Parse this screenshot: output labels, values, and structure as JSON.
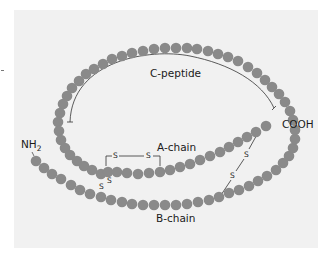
{
  "colors": {
    "bead": "#8a8a8a",
    "panel": "#f1f1f1",
    "line": "#333333",
    "text": "#1a1a1a"
  },
  "labels": {
    "c_peptide": "C-peptide",
    "a_chain": "A-chain",
    "b_chain": "B-chain",
    "n_terminus": "NH",
    "n_terminus_sub": "2",
    "c_terminus": "COOH",
    "disulfide": "S"
  },
  "disulfide_bonds": [
    {
      "name": "intra-A-chain",
      "from": "A6",
      "to": "A11",
      "label": "S—S"
    },
    {
      "name": "A7-B7",
      "label": "S S"
    },
    {
      "name": "A20-B19",
      "label": "S S"
    }
  ],
  "chain": {
    "bead_radius": 5.3,
    "b_chain": [
      [
        36,
        161
      ],
      [
        44,
        168
      ],
      [
        52,
        174
      ],
      [
        61,
        179
      ],
      [
        71,
        185
      ],
      [
        80,
        190
      ],
      [
        90,
        194
      ],
      [
        101,
        197
      ],
      [
        111,
        200
      ],
      [
        122,
        202
      ],
      [
        132,
        204
      ],
      [
        143,
        205
      ],
      [
        154,
        205
      ],
      [
        165,
        205
      ],
      [
        176,
        205
      ],
      [
        187,
        204
      ],
      [
        198,
        202
      ],
      [
        209,
        200
      ],
      [
        219,
        197
      ],
      [
        229,
        193
      ],
      [
        239,
        190
      ],
      [
        249,
        186
      ],
      [
        258,
        181
      ],
      [
        267,
        176
      ],
      [
        276,
        170
      ],
      [
        283,
        163
      ],
      [
        289,
        156
      ],
      [
        293,
        148
      ],
      [
        295,
        139
      ],
      [
        295,
        130
      ]
    ],
    "c_peptide_loop": [
      [
        293,
        120
      ],
      [
        290,
        111
      ],
      [
        285,
        102
      ],
      [
        279,
        94
      ],
      [
        272,
        87
      ],
      [
        265,
        80
      ],
      [
        257,
        73
      ],
      [
        248,
        67
      ],
      [
        238,
        61
      ],
      [
        228,
        57
      ],
      [
        218,
        54
      ],
      [
        208,
        51
      ],
      [
        197,
        49
      ],
      [
        187,
        48
      ],
      [
        176,
        48
      ],
      [
        165,
        48
      ],
      [
        154,
        49
      ],
      [
        143,
        51
      ],
      [
        132,
        53
      ],
      [
        122,
        56
      ],
      [
        112,
        59
      ],
      [
        103,
        64
      ],
      [
        94,
        69
      ],
      [
        86,
        74
      ],
      [
        79,
        81
      ],
      [
        72,
        88
      ],
      [
        67,
        96
      ],
      [
        63,
        104
      ],
      [
        60,
        113
      ],
      [
        58,
        122
      ],
      [
        59,
        131
      ],
      [
        61,
        140
      ],
      [
        65,
        148
      ],
      [
        70,
        155
      ],
      [
        77,
        161
      ],
      [
        84,
        166
      ],
      [
        92,
        170
      ],
      [
        101,
        174
      ],
      [
        108,
        172
      ]
    ],
    "a_chain": [
      [
        117,
        172
      ],
      [
        127,
        173
      ],
      [
        138,
        174
      ],
      [
        149,
        173
      ],
      [
        160,
        172
      ],
      [
        170,
        170
      ],
      [
        180,
        167
      ],
      [
        190,
        164
      ],
      [
        200,
        160
      ],
      [
        210,
        156
      ],
      [
        220,
        152
      ],
      [
        229,
        147
      ],
      [
        238,
        142
      ],
      [
        247,
        137
      ],
      [
        256,
        132
      ],
      [
        266,
        126
      ]
    ]
  }
}
